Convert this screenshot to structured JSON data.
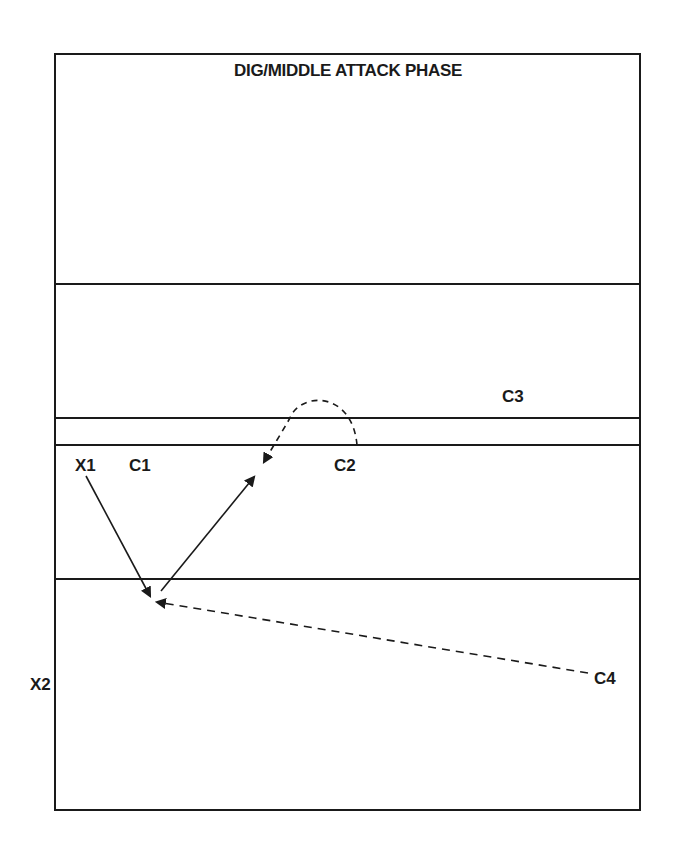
{
  "diagram": {
    "title": "DIG/MIDDLE ATTACK PHASE",
    "court": {
      "stroke_color": "#1a1a1a",
      "background": "#ffffff",
      "border": {
        "x1": 55,
        "y1": 54,
        "x2": 640,
        "y2": 810
      },
      "horizontal_lines_y": [
        284,
        418,
        445,
        579
      ]
    },
    "players": [
      {
        "id": "X1",
        "label": "X1",
        "x": 75,
        "y": 471
      },
      {
        "id": "C1",
        "label": "C1",
        "x": 129,
        "y": 471
      },
      {
        "id": "C2",
        "label": "C2",
        "x": 334,
        "y": 471
      },
      {
        "id": "C3",
        "label": "C3",
        "x": 502,
        "y": 402
      },
      {
        "id": "C4",
        "label": "C4",
        "x": 594,
        "y": 684
      },
      {
        "id": "X2",
        "label": "X2",
        "x": 30,
        "y": 690
      }
    ],
    "paths": [
      {
        "id": "x1-to-dig",
        "style": "solid",
        "from": "X1",
        "description": "X1 moves down to dig position"
      },
      {
        "id": "dig-to-middle",
        "style": "solid",
        "from": "dig",
        "description": "pass from dig position up toward the middle"
      },
      {
        "id": "c2-loop",
        "style": "dashed",
        "from": "C2",
        "description": "C2 loops over toward the attack position"
      },
      {
        "id": "c4-to-dig",
        "style": "dashed",
        "from": "C4",
        "description": "C4 moves toward dig position"
      }
    ]
  }
}
